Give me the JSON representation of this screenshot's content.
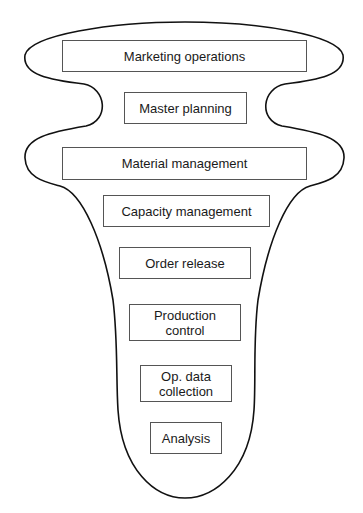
{
  "diagram": {
    "type": "funnel-hierarchy",
    "outline_color": "#111111",
    "boxes": [
      {
        "label": "Marketing operations"
      },
      {
        "label": "Master planning"
      },
      {
        "label": "Material management"
      },
      {
        "label": "Capacity management"
      },
      {
        "label": "Order release"
      },
      {
        "label": "Production\ncontrol"
      },
      {
        "label": "Op. data\ncollection"
      },
      {
        "label": "Analysis"
      }
    ]
  }
}
